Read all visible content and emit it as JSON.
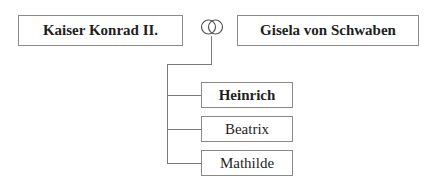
{
  "parents": {
    "father": {
      "name": "Kaiser Konrad II."
    },
    "mother": {
      "name": "Gisela von Schwaben"
    },
    "marriage_symbol": "wedding-rings-icon"
  },
  "children": [
    {
      "name": "Heinrich",
      "bold": true
    },
    {
      "name": "Beatrix",
      "bold": false
    },
    {
      "name": "Mathilde",
      "bold": false
    }
  ],
  "colors": {
    "border": "#8a8a8a",
    "line": "#7a7a7a",
    "text": "#1e1e1e",
    "background": "#ffffff"
  }
}
